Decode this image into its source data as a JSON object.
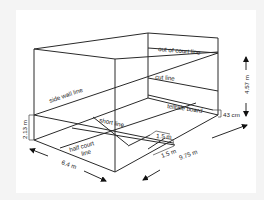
{
  "diagram": {
    "labels": {
      "out_of_court_line": "out of court line",
      "cut_line": "cut line",
      "telltale_board": "telltale board",
      "side_wall_line": "side wall line",
      "short_line": "short line",
      "half_court_line_1": "half court",
      "half_court_line_2": "line"
    },
    "dimensions": {
      "wall_height": "4.57 m",
      "telltale_height": "43 cm",
      "side_wall_back_height": "2.13 m",
      "court_width": "6.4 m",
      "court_length": "9.75 m",
      "service_box_depth": "1.5 m",
      "service_box_width": "1.5 m"
    },
    "colors": {
      "line": "#2a2a2a",
      "background": "#ffffff",
      "outer": "#f4f4f4"
    }
  }
}
